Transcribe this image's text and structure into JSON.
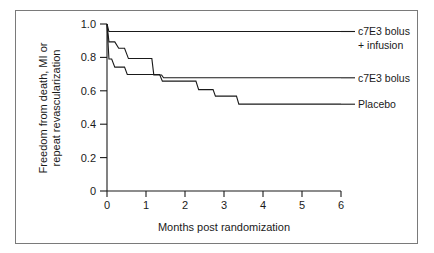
{
  "chart_data": {
    "type": "line",
    "subtype": "kaplan-meier-step",
    "title": "",
    "xlabel": "Months post randomization",
    "ylabel": "Freedom from death, MI or repeat revascularization",
    "ylabel_line1": "Freedom from death, MI or",
    "ylabel_line2": "repeat revascularization",
    "xlim": [
      0,
      6
    ],
    "ylim": [
      0,
      1.0
    ],
    "xticks": [
      0,
      1,
      2,
      3,
      4,
      5,
      6
    ],
    "xtick_labels": [
      "0",
      "1",
      "2",
      "3",
      "4",
      "5",
      "6"
    ],
    "yticks": [
      0,
      0.2,
      0.4,
      0.6,
      0.8,
      1.0
    ],
    "ytick_labels": [
      "0",
      "0.2",
      "0.4",
      "0.6",
      "0.8",
      "1.0"
    ],
    "grid": false,
    "legend_position": "right-inline-labels",
    "series": [
      {
        "name": "c7E3 bolus + infusion",
        "label_line1": "c7E3 bolus",
        "label_line2": "+ infusion",
        "color": "#1a1a1a",
        "final_value": 0.955,
        "x": [
          0.0,
          0.05,
          6.0
        ],
        "y": [
          1.0,
          0.955,
          0.955
        ]
      },
      {
        "name": "c7E3 bolus",
        "label_line1": "c7E3 bolus",
        "label_line2": "",
        "color": "#1a1a1a",
        "final_value": 0.678,
        "x": [
          0.0,
          0.05,
          0.2,
          0.3,
          0.45,
          0.55,
          1.15,
          1.2,
          1.4,
          1.45,
          6.0
        ],
        "y": [
          1.0,
          0.893,
          0.893,
          0.855,
          0.855,
          0.793,
          0.793,
          0.695,
          0.695,
          0.678,
          0.678
        ]
      },
      {
        "name": "Placebo",
        "label_line1": "Placebo",
        "label_line2": "",
        "color": "#1a1a1a",
        "final_value": 0.52,
        "x": [
          0.0,
          0.05,
          0.12,
          0.2,
          0.45,
          0.52,
          1.35,
          1.42,
          2.28,
          2.35,
          2.72,
          2.78,
          3.32,
          3.38,
          6.0
        ],
        "y": [
          1.0,
          0.79,
          0.79,
          0.742,
          0.742,
          0.698,
          0.698,
          0.658,
          0.658,
          0.607,
          0.607,
          0.568,
          0.568,
          0.52,
          0.52
        ]
      }
    ],
    "annotations": [
      {
        "text": "c7E3 bolus + infusion",
        "at_y": 0.955
      },
      {
        "text": "c7E3 bolus",
        "at_y": 0.678
      },
      {
        "text": "Placebo",
        "at_y": 0.52
      }
    ]
  }
}
